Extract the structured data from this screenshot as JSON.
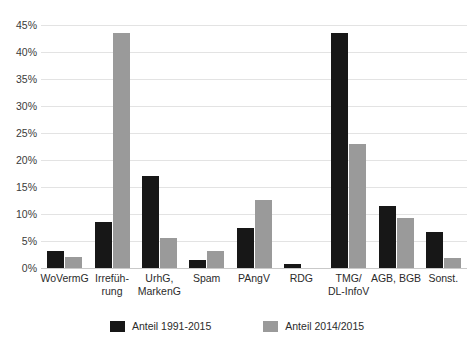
{
  "chart_data": {
    "type": "bar",
    "title": "Anteile der Verstöße 1991-2015 und 2014/2015",
    "xlabel": "",
    "ylabel": "",
    "ylim": [
      0,
      45
    ],
    "ytick_step": 5,
    "ytick_labels": [
      "0%",
      "5%",
      "10%",
      "15%",
      "20%",
      "25%",
      "30%",
      "35%",
      "40%",
      "45%"
    ],
    "ytick_values": [
      0,
      5,
      10,
      15,
      20,
      25,
      30,
      35,
      40,
      45
    ],
    "grid": true,
    "legend_position": "bottom",
    "categories": [
      "WoVermG",
      "Irrefüh-\nrung",
      "UrhG,\nMarkenG",
      "Spam",
      "PAngV",
      "RDG",
      "TMG/\nDL-InfoV",
      "AGB, BGB",
      "Sonst."
    ],
    "category_lines": [
      [
        "WoVermG"
      ],
      [
        "Irrefüh-",
        "rung"
      ],
      [
        "UrhG,",
        "MarkenG"
      ],
      [
        "Spam"
      ],
      [
        "PAngV"
      ],
      [
        "RDG"
      ],
      [
        "TMG/",
        "DL-InfoV"
      ],
      [
        "AGB, BGB"
      ],
      [
        "Sonst."
      ]
    ],
    "series": [
      {
        "name": "Anteil 1991-2015",
        "color": "#171717",
        "values": [
          3.2,
          8.6,
          17.0,
          1.5,
          7.4,
          0.8,
          43.6,
          11.5,
          6.6
        ]
      },
      {
        "name": "Anteil 2014/2015",
        "color": "#9a9a9a",
        "values": [
          2.0,
          43.5,
          5.5,
          3.1,
          12.6,
          0.0,
          23.0,
          9.3,
          1.8
        ]
      }
    ]
  },
  "legend": {
    "items": [
      {
        "label": "Anteil 1991-2015",
        "color": "#171717"
      },
      {
        "label": "Anteil 2014/2015",
        "color": "#9a9a9a"
      }
    ]
  }
}
